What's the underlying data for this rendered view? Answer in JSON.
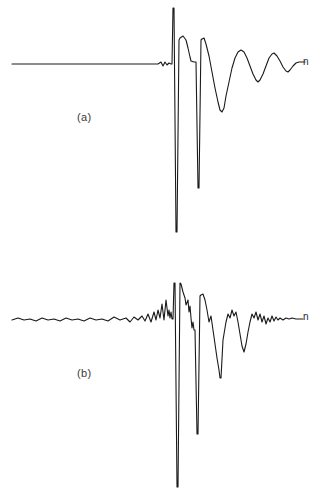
{
  "figure": {
    "background_color": "#ffffff",
    "trace_color": "#1a1a1a",
    "width": 321,
    "height": 498
  },
  "panels": [
    {
      "id": "a",
      "caption": "(a)",
      "axis_label": "n",
      "baseline_y": 64,
      "description": "clean decaying oscillatory impulse response"
    },
    {
      "id": "b",
      "caption": "(b)",
      "axis_label": "n",
      "baseline_y": 319,
      "description": "noisy decaying oscillatory impulse response"
    }
  ],
  "chart_data": {
    "type": "line",
    "title": "",
    "xlabel": "n",
    "ylabel": "",
    "grid": false,
    "legend": "none",
    "axis_ranges": {
      "x": [
        0,
        321
      ],
      "y_panel_a": [
        0,
        249
      ],
      "y_panel_b": [
        249,
        498
      ]
    },
    "series": [
      {
        "name": "(a)",
        "panel": "a",
        "baseline": 64,
        "points": [
          [
            12,
            64
          ],
          [
            30,
            64
          ],
          [
            55,
            64
          ],
          [
            80,
            64
          ],
          [
            105,
            64
          ],
          [
            130,
            64
          ],
          [
            150,
            64
          ],
          [
            158,
            64
          ],
          [
            161,
            62
          ],
          [
            163,
            66
          ],
          [
            165,
            62
          ],
          [
            167,
            65
          ],
          [
            169,
            63
          ],
          [
            171,
            64
          ],
          [
            172,
            64
          ],
          [
            173,
            8
          ],
          [
            174,
            8
          ],
          [
            176,
            232
          ],
          [
            177,
            232
          ],
          [
            179,
            40
          ],
          [
            180,
            38
          ],
          [
            183,
            36
          ],
          [
            186,
            40
          ],
          [
            188,
            48
          ],
          [
            190,
            57
          ],
          [
            191,
            61
          ],
          [
            194,
            62
          ],
          [
            195,
            62
          ],
          [
            196,
            62
          ],
          [
            198,
            188
          ],
          [
            199,
            188
          ],
          [
            201,
            40
          ],
          [
            202,
            39
          ],
          [
            204,
            38
          ],
          [
            206,
            44
          ],
          [
            209,
            56
          ],
          [
            212,
            72
          ],
          [
            215,
            88
          ],
          [
            218,
            102
          ],
          [
            220,
            110
          ],
          [
            222,
            112
          ],
          [
            224,
            108
          ],
          [
            226,
            96
          ],
          [
            229,
            82
          ],
          [
            232,
            68
          ],
          [
            235,
            58
          ],
          [
            238,
            52
          ],
          [
            241,
            50
          ],
          [
            244,
            52
          ],
          [
            247,
            58
          ],
          [
            250,
            66
          ],
          [
            253,
            74
          ],
          [
            256,
            80
          ],
          [
            258,
            82
          ],
          [
            260,
            80
          ],
          [
            263,
            74
          ],
          [
            266,
            66
          ],
          [
            269,
            58
          ],
          [
            272,
            54
          ],
          [
            274,
            53
          ],
          [
            277,
            56
          ],
          [
            280,
            61
          ],
          [
            283,
            67
          ],
          [
            286,
            71
          ],
          [
            288,
            72
          ],
          [
            290,
            70
          ],
          [
            293,
            66
          ],
          [
            296,
            63
          ],
          [
            299,
            62
          ],
          [
            302,
            62
          ],
          [
            305,
            62
          ]
        ]
      },
      {
        "name": "(b)",
        "panel": "b",
        "baseline": 319,
        "points": [
          [
            12,
            320
          ],
          [
            18,
            318
          ],
          [
            24,
            320
          ],
          [
            30,
            319
          ],
          [
            36,
            321
          ],
          [
            42,
            318
          ],
          [
            48,
            320
          ],
          [
            54,
            319
          ],
          [
            60,
            321
          ],
          [
            66,
            318
          ],
          [
            72,
            320
          ],
          [
            78,
            319
          ],
          [
            84,
            321
          ],
          [
            90,
            318
          ],
          [
            96,
            320
          ],
          [
            102,
            319
          ],
          [
            108,
            321
          ],
          [
            114,
            317
          ],
          [
            120,
            320
          ],
          [
            126,
            318
          ],
          [
            130,
            322
          ],
          [
            134,
            317
          ],
          [
            138,
            320
          ],
          [
            142,
            316
          ],
          [
            145,
            321
          ],
          [
            148,
            314
          ],
          [
            151,
            322
          ],
          [
            154,
            312
          ],
          [
            156,
            320
          ],
          [
            158,
            310
          ],
          [
            160,
            318
          ],
          [
            162,
            304
          ],
          [
            164,
            320
          ],
          [
            166,
            300
          ],
          [
            168,
            316
          ],
          [
            169,
            310
          ],
          [
            170,
            318
          ],
          [
            171,
            312
          ],
          [
            172,
            319
          ],
          [
            173,
            319
          ],
          [
            174,
            283
          ],
          [
            175,
            283
          ],
          [
            177,
            487
          ],
          [
            178,
            487
          ],
          [
            180,
            283
          ],
          [
            181,
            284
          ],
          [
            183,
            292
          ],
          [
            185,
            298
          ],
          [
            186,
            305
          ],
          [
            188,
            300
          ],
          [
            189,
            312
          ],
          [
            190,
            306
          ],
          [
            191,
            318
          ],
          [
            192,
            328
          ],
          [
            193,
            322
          ],
          [
            194,
            330
          ],
          [
            195,
            330
          ],
          [
            197,
            434
          ],
          [
            198,
            434
          ],
          [
            200,
            296
          ],
          [
            201,
            295
          ],
          [
            203,
            294
          ],
          [
            205,
            300
          ],
          [
            207,
            310
          ],
          [
            209,
            322
          ],
          [
            211,
            316
          ],
          [
            213,
            330
          ],
          [
            215,
            344
          ],
          [
            217,
            358
          ],
          [
            219,
            370
          ],
          [
            220,
            378
          ],
          [
            221,
            378
          ],
          [
            223,
            340
          ],
          [
            224,
            334
          ],
          [
            226,
            322
          ],
          [
            228,
            314
          ],
          [
            230,
            318
          ],
          [
            232,
            310
          ],
          [
            234,
            316
          ],
          [
            236,
            312
          ],
          [
            238,
            322
          ],
          [
            240,
            334
          ],
          [
            242,
            346
          ],
          [
            244,
            352
          ],
          [
            246,
            344
          ],
          [
            248,
            332
          ],
          [
            250,
            322
          ],
          [
            252,
            314
          ],
          [
            254,
            318
          ],
          [
            256,
            312
          ],
          [
            258,
            320
          ],
          [
            260,
            314
          ],
          [
            262,
            322
          ],
          [
            264,
            316
          ],
          [
            266,
            324
          ],
          [
            268,
            318
          ],
          [
            270,
            322
          ],
          [
            272,
            316
          ],
          [
            274,
            321
          ],
          [
            276,
            317
          ],
          [
            278,
            320
          ],
          [
            280,
            318
          ],
          [
            283,
            320
          ],
          [
            286,
            318
          ],
          [
            289,
            319
          ],
          [
            292,
            318
          ],
          [
            296,
            319
          ],
          [
            300,
            319
          ],
          [
            303,
            319
          ]
        ]
      }
    ]
  }
}
